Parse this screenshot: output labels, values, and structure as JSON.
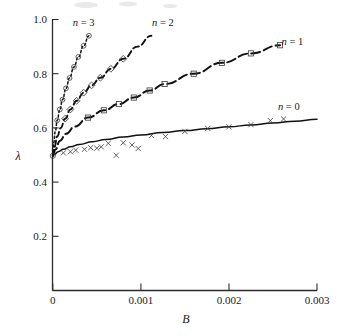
{
  "chart_data": {
    "type": "line",
    "title": "",
    "subtitle": "",
    "xlabel": "B",
    "ylabel": "λ",
    "xlim": [
      0,
      0.003
    ],
    "ylim": [
      0,
      1.0
    ],
    "grid": false,
    "legend_position": "inline-annotations",
    "xticks": [
      0,
      0.001,
      0.002,
      0.003
    ],
    "xtick_labels": [
      "0",
      "0.001",
      "0.002",
      "0.003"
    ],
    "yticks": [
      0.2,
      0.4,
      0.6,
      0.8,
      1.0
    ],
    "ytick_labels": [
      "0.2",
      "0.4",
      "0.6",
      "0.8",
      "1.0"
    ],
    "annotations": [
      {
        "text": "n = 3",
        "x": 0.00035,
        "y": 0.975,
        "label_for": "n3"
      },
      {
        "text": "n = 2",
        "x": 0.00125,
        "y": 0.975,
        "label_for": "n2"
      },
      {
        "text": "n = 1",
        "x": 0.00272,
        "y": 0.905,
        "label_for": "n1"
      },
      {
        "text": "n = 0",
        "x": 0.00268,
        "y": 0.665,
        "label_for": "n0"
      }
    ],
    "series": [
      {
        "name": "n = 0",
        "line_style": "solid",
        "marker": "none",
        "color": "#111111",
        "x": [
          0.0,
          2e-05,
          6e-05,
          0.00012,
          0.0002,
          0.0003,
          0.00045,
          0.0006,
          0.0008,
          0.001,
          0.00125,
          0.0015,
          0.00175,
          0.002,
          0.00225,
          0.0025,
          0.00275,
          0.003
        ],
        "y": [
          0.497,
          0.503,
          0.512,
          0.521,
          0.53,
          0.539,
          0.549,
          0.557,
          0.566,
          0.574,
          0.583,
          0.59,
          0.597,
          0.604,
          0.611,
          0.618,
          0.625,
          0.632
        ]
      },
      {
        "name": "n = 1",
        "line_style": "long-dash",
        "marker": "square",
        "color": "#111111",
        "x": [
          0.0,
          3e-05,
          8e-05,
          0.00015,
          0.00025,
          0.0004,
          0.00058,
          0.00075,
          0.00092,
          0.0011,
          0.00127,
          0.0016,
          0.00192,
          0.00225,
          0.00258
        ],
        "y": [
          0.497,
          0.52,
          0.552,
          0.578,
          0.605,
          0.638,
          0.665,
          0.688,
          0.712,
          0.738,
          0.762,
          0.8,
          0.84,
          0.875,
          0.905
        ],
        "marker_x": [
          0.0004,
          0.00058,
          0.00075,
          0.00092,
          0.0011,
          0.00127,
          0.0016,
          0.00192,
          0.00225,
          0.00258
        ],
        "marker_y": [
          0.638,
          0.665,
          0.688,
          0.712,
          0.738,
          0.762,
          0.8,
          0.84,
          0.875,
          0.905
        ]
      },
      {
        "name": "n = 2",
        "line_style": "dash",
        "marker": "diamond",
        "color": "#111111",
        "x": [
          0.0,
          2e-05,
          5e-05,
          9e-05,
          0.00014,
          0.0002,
          0.00027,
          0.00035,
          0.00044,
          0.00054,
          0.00066,
          0.0008,
          0.00096,
          0.00112
        ],
        "y": [
          0.497,
          0.53,
          0.568,
          0.6,
          0.634,
          0.668,
          0.7,
          0.73,
          0.757,
          0.785,
          0.818,
          0.855,
          0.9,
          0.94
        ],
        "marker_x": [
          0.00014,
          0.0002,
          0.00027,
          0.00035,
          0.00044,
          0.00054,
          0.00066,
          0.0008
        ],
        "marker_y": [
          0.634,
          0.668,
          0.7,
          0.73,
          0.757,
          0.785,
          0.818,
          0.855
        ]
      },
      {
        "name": "n = 3",
        "line_style": "dot",
        "marker": "circle",
        "color": "#111111",
        "x": [
          0.0,
          1e-05,
          3e-05,
          5e-05,
          8e-05,
          0.00011,
          0.00015,
          0.00019,
          0.00024,
          0.00029,
          0.00035,
          0.00041
        ],
        "y": [
          0.497,
          0.545,
          0.59,
          0.628,
          0.668,
          0.704,
          0.746,
          0.784,
          0.825,
          0.862,
          0.903,
          0.94
        ],
        "marker_x": [
          5e-05,
          8e-05,
          0.00011,
          0.00015,
          0.00019,
          0.00024,
          0.00029,
          0.00035,
          0.00041
        ],
        "marker_y": [
          0.628,
          0.668,
          0.704,
          0.746,
          0.784,
          0.825,
          0.862,
          0.903,
          0.94
        ]
      },
      {
        "name": "measured-data",
        "line_style": "none",
        "marker": "x",
        "color": "#444444",
        "x": [
          0.00012,
          0.0002,
          0.00026,
          0.00036,
          0.00043,
          0.0005,
          0.00055,
          0.00063,
          0.00072,
          0.0008,
          0.0009,
          0.00097,
          0.00112,
          0.00128,
          0.0015,
          0.00176,
          0.002,
          0.00225,
          0.00247,
          0.00262
        ],
        "y": [
          0.508,
          0.512,
          0.518,
          0.521,
          0.527,
          0.525,
          0.53,
          0.543,
          0.499,
          0.545,
          0.537,
          0.524,
          0.572,
          0.568,
          0.587,
          0.598,
          0.604,
          0.612,
          0.627,
          0.633
        ]
      }
    ]
  }
}
